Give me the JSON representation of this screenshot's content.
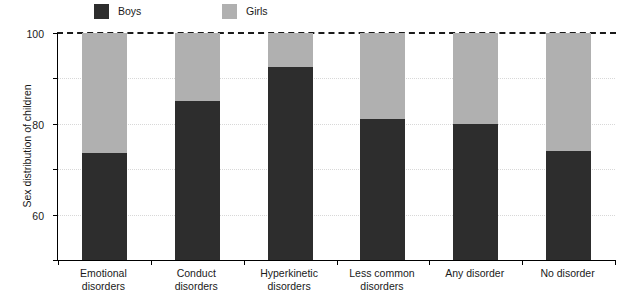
{
  "chart_data": {
    "type": "bar",
    "subtype": "stacked-100-percent",
    "title": "",
    "xlabel": "",
    "ylabel": "Sex distribution of children",
    "ylim": [
      0,
      100
    ],
    "yticks": [
      0,
      20,
      40,
      60,
      80,
      100
    ],
    "ytick_labels": [
      "0",
      "20",
      "40",
      "60",
      "80",
      "100"
    ],
    "grid": "horizontal-dotted",
    "legend_position": "top",
    "reference_line": {
      "value": 100,
      "style": "dashed"
    },
    "categories": [
      "Emotional disorders",
      "Conduct disorders",
      "Hyperkinetic disorders",
      "Less common disorders",
      "Any disorder",
      "No disorder"
    ],
    "category_lines": [
      [
        "Emotional",
        "disorders"
      ],
      [
        "Conduct",
        "disorders"
      ],
      [
        "Hyperkinetic",
        "disorders"
      ],
      [
        "Less common",
        "disorders"
      ],
      [
        "Any disorder"
      ],
      [
        "No disorder"
      ]
    ],
    "series": [
      {
        "name": "Boys",
        "color": "#2d2d2d",
        "values": [
          47,
          70,
          85,
          62,
          60,
          48
        ]
      },
      {
        "name": "Girls",
        "color": "#b0b0b0",
        "values": [
          53,
          30,
          15,
          38,
          40,
          52
        ]
      }
    ]
  },
  "legend": {
    "boys_label": "Boys",
    "girls_label": "Girls",
    "boys_color": "#2d2d2d",
    "girls_color": "#b0b0b0"
  },
  "axis": {
    "y_title": "Sex distribution of children"
  }
}
